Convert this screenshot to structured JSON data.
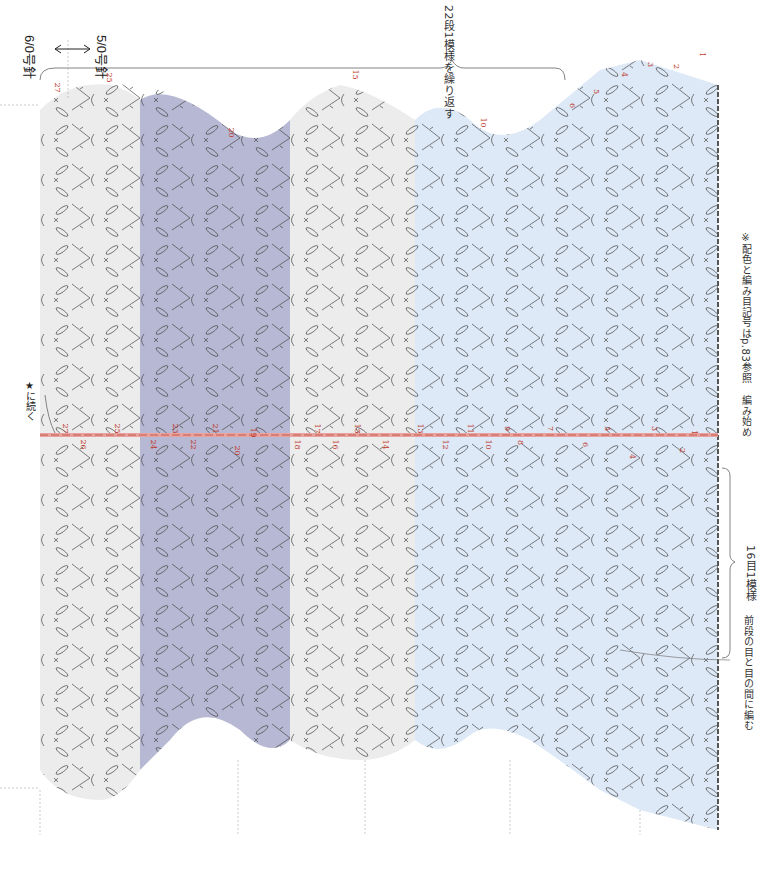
{
  "diagram": {
    "type": "crochet-chart",
    "orientation": "rotated-90",
    "colors": {
      "band_light_blue": "#dde9f7",
      "band_gray_light": "#ececec",
      "band_lavender": "#b7b8d3",
      "stitch_line": "#3d3d3d",
      "center_chain": "#e7a3a0",
      "row_number": "#c0392b",
      "guide_line": "#9a9a9a"
    },
    "needle_labels": {
      "left": "6/0号針",
      "right": "5/0号針",
      "arrow": "↔"
    },
    "annotations": {
      "repeat_note": "22段1模様を繰り返す",
      "color_note": "※配色と編み目記号はp.83参照",
      "start_label": "編み始め",
      "pattern_repeat": "16目1模様",
      "between_note": "前段の目と目の間に編む",
      "continue_note": "★に続く"
    },
    "row_markers_edge": [
      "1",
      "2",
      "3",
      "4",
      "5",
      "6",
      "10",
      "15",
      "20",
      "25",
      "27"
    ],
    "center_row_numbers": [
      "1",
      "2",
      "3",
      "4",
      "5",
      "6",
      "7",
      "8",
      "9",
      "10",
      "11",
      "12",
      "13",
      "14",
      "15",
      "16",
      "17",
      "18",
      "19",
      "20",
      "21",
      "22",
      "23",
      "24",
      "25",
      "26",
      "27"
    ],
    "bands": [
      {
        "name": "rows-1-12",
        "color": "light-blue"
      },
      {
        "name": "rows-13-18",
        "color": "light-gray"
      },
      {
        "name": "rows-19-24",
        "color": "lavender"
      },
      {
        "name": "rows-25-27",
        "color": "light-gray"
      }
    ]
  }
}
